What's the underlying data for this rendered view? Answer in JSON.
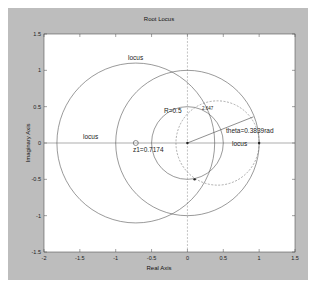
{
  "chart_data": {
    "type": "line",
    "title": "Root Locus",
    "xlabel": "Real Axis",
    "ylabel": "Imaginary Axis",
    "xlim": [
      -2,
      1.5
    ],
    "ylim": [
      -1.5,
      1.5
    ],
    "grid": false,
    "xticks": [
      "-2",
      "-1.5",
      "-1",
      "-0.5",
      "0",
      "0.5",
      "1",
      "1.5"
    ],
    "yticks": [
      "1.5",
      "1",
      "0.5",
      "0",
      "-0.5",
      "-1",
      "-1.5"
    ],
    "circles": [
      {
        "name": "locus-left",
        "center": [
          -0.72,
          0
        ],
        "radius": 1.1,
        "style": "solid"
      },
      {
        "name": "unit-circle",
        "center": [
          0,
          0
        ],
        "radius": 1.0,
        "style": "solid"
      },
      {
        "name": "R=0.5 circle",
        "center": [
          0,
          0
        ],
        "radius": 0.5,
        "style": "solid"
      },
      {
        "name": "dashed-circle",
        "center": [
          0.42,
          0
        ],
        "radius": 0.58,
        "style": "dashed"
      }
    ],
    "segments": [
      {
        "from": [
          0,
          0
        ],
        "to": [
          0.92,
          0.36
        ],
        "label": "theta=0.3839rad"
      }
    ],
    "markers": [
      {
        "x": -0.72,
        "y": 0,
        "shape": "o",
        "label": "z1=0.7174"
      },
      {
        "x": 0,
        "y": 0,
        "shape": "dot"
      },
      {
        "x": 1.0,
        "y": 0,
        "shape": "dot"
      },
      {
        "x": 0.1,
        "y": -0.5,
        "shape": "dot"
      }
    ],
    "annotations": [
      {
        "text": "locus",
        "x": -0.75,
        "y": 1.12
      },
      {
        "text": "locus",
        "x": -1.5,
        "y": 0.06
      },
      {
        "text": "locus",
        "x": 0.68,
        "y": 0.0
      },
      {
        "text": "R=0.5",
        "x": -0.3,
        "y": 0.42
      },
      {
        "text": "2.647",
        "x": 0.25,
        "y": 0.46
      },
      {
        "text": "theta=0.3839rad",
        "x": 0.5,
        "y": 0.1
      },
      {
        "text": "z1=0.7174",
        "x": -0.8,
        "y": -0.08
      }
    ]
  },
  "labels": {
    "title": "Root Locus",
    "xlabel": "Real Axis",
    "ylabel": "Imaginary Axis",
    "locus1": "locus",
    "locus2": "locus",
    "locus3": "locus",
    "r": "R=0.5",
    "small": "2.647",
    "theta": "theta=0.3839rad",
    "z1": "z1=0.7174"
  }
}
